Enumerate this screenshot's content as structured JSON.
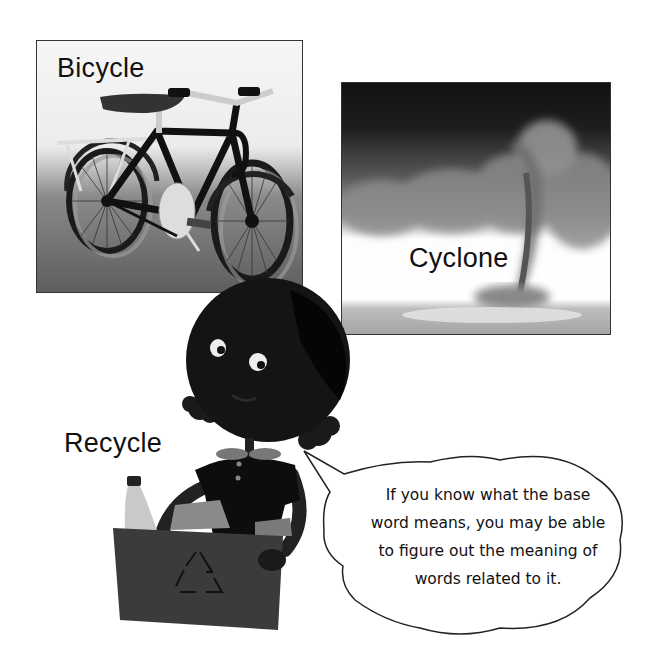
{
  "panels": {
    "bicycle": {
      "label": "Bicycle",
      "image": "bicycle-illustration"
    },
    "cyclone": {
      "label": "Cyclone",
      "image": "tornado-illustration"
    }
  },
  "character": {
    "label": "Recycle",
    "props": [
      "recycling-bin",
      "bottle",
      "paper"
    ],
    "icon": "recycle-icon"
  },
  "speech_bubble": {
    "lines": [
      "If you know what the base",
      "word means, you may be able",
      "to figure out the meaning of",
      "words related to it."
    ]
  }
}
